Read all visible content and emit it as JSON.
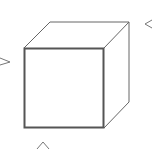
{
  "diagram": {
    "type": "cube-projection-views",
    "colors": {
      "background": "#ffffff",
      "front_face_stroke": "#555555",
      "edge_stroke": "#666666",
      "arrow_stroke": "#777777"
    },
    "arrows": [
      {
        "id": "left-view-arrow",
        "glyph": ">",
        "direction": "pointing-right"
      },
      {
        "id": "right-view-arrow",
        "glyph": "<",
        "direction": "pointing-left"
      },
      {
        "id": "bottom-view-arrow",
        "glyph": "^",
        "direction": "pointing-up"
      }
    ]
  }
}
